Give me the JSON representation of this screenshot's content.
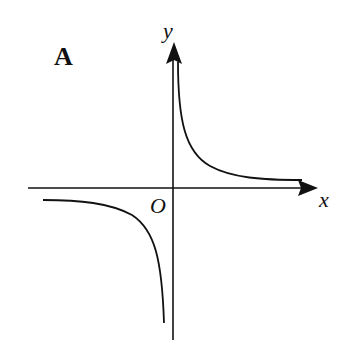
{
  "diagram": {
    "panel_label": "A",
    "type": "graph of inverse proportion function (hyperbola, k>0)",
    "axes": {
      "x_label": "x",
      "y_label": "y",
      "origin_label": "O"
    },
    "curves": [
      {
        "name": "first-quadrant-branch",
        "quadrant": "I"
      },
      {
        "name": "third-quadrant-branch",
        "quadrant": "III"
      }
    ],
    "colors": {
      "stroke": "#111111",
      "background": "#ffffff"
    }
  }
}
